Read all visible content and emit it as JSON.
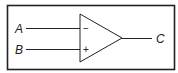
{
  "diagram": {
    "type": "op-amp comparator",
    "inputs": [
      {
        "label": "A",
        "terminal": "−"
      },
      {
        "label": "B",
        "terminal": "+"
      }
    ],
    "output": {
      "label": "C"
    },
    "colors": {
      "stroke": "#222222",
      "background": "#ffffff"
    }
  }
}
